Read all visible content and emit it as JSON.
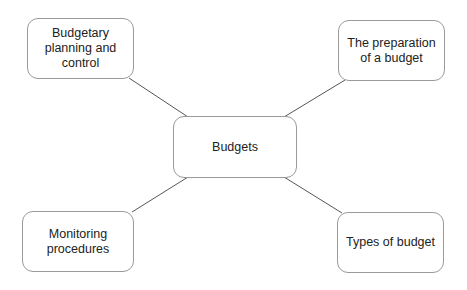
{
  "diagram": {
    "type": "mind-map",
    "center": {
      "label": "Budgets"
    },
    "branches": [
      {
        "id": "top-left",
        "label": "Budgetary\nplanning and control"
      },
      {
        "id": "top-right",
        "label": "The preparation\nof a budget"
      },
      {
        "id": "bottom-left",
        "label": "Monitoring\nprocedures"
      },
      {
        "id": "bottom-right",
        "label": "Types of budget"
      }
    ],
    "colors": {
      "border": "#9a9a9a",
      "line": "#555555",
      "text": "#222222",
      "background": "#ffffff"
    }
  }
}
